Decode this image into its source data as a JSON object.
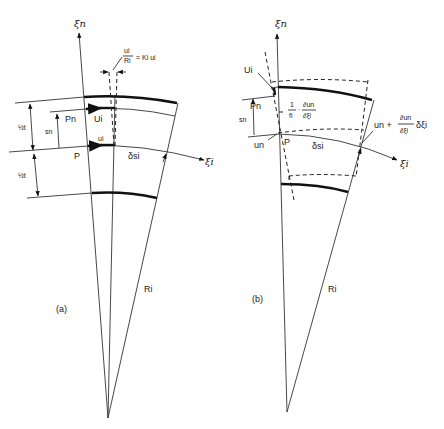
{
  "figure": {
    "panel_a": {
      "label": "(a)",
      "axis_normal": "ξn",
      "axis_tangent": "ξi",
      "radius_label": "Ri",
      "annotation_top": "ui/Ri = Ki ui",
      "annotation_top_num": "ui",
      "annotation_top_den": "Ri",
      "annotation_top_rest": "= Ki ui",
      "half_thickness_top": "½t",
      "half_thickness_bottom": "½t",
      "offset_label": "sn",
      "point_upper": "Pn",
      "point_mid": "P",
      "disp_upper": "Ui",
      "disp_mid": "ui",
      "arc_label": "δsi"
    },
    "panel_b": {
      "label": "(b)",
      "axis_normal": "ξn",
      "axis_tangent": "ξi",
      "radius_label": "Ri",
      "disp_upper": "Ui",
      "point_upper": "Pn",
      "offset_label": "sn",
      "rotation_label_prefix": "1/fi ·",
      "rotation_num": "∂un",
      "rotation_den": "∂ξi",
      "rotation_frac_num": "1",
      "rotation_frac_den": "fi",
      "disp_normal": "un",
      "point_mid": "P",
      "arc_label": "δsi",
      "right_disp_prefix": "un +",
      "right_disp_num": "∂un",
      "right_disp_den": "∂ξi",
      "right_disp_suffix": "δξi"
    }
  }
}
